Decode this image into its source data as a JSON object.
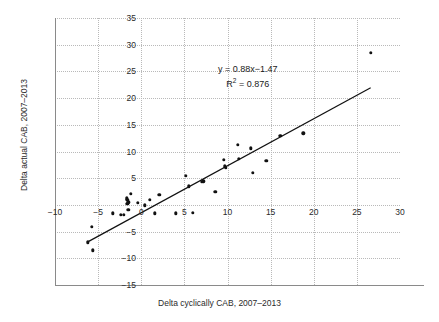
{
  "chart_data": {
    "type": "scatter",
    "title": "",
    "xlabel": "Delta cyclically CAB, 2007–2013",
    "ylabel": "Delta actual CAB, 2007–2013",
    "xlim": [
      -10,
      30
    ],
    "ylim": [
      -15,
      35
    ],
    "xticks": [
      -10,
      -5,
      0,
      5,
      10,
      15,
      20,
      25,
      30
    ],
    "xticklabels": [
      "−10",
      "−5",
      "0",
      "5",
      "10",
      "15",
      "20",
      "25",
      "30"
    ],
    "yticks": [
      -15,
      -10,
      -5,
      0,
      5,
      10,
      15,
      20,
      25,
      30,
      35
    ],
    "yticklabels": [
      "−15",
      "−10",
      "−5",
      "",
      "5",
      "10",
      "15",
      "20",
      "25",
      "30",
      "35"
    ],
    "grid": true,
    "grid_style": "dotted",
    "legend": null,
    "marker_color": "#111111",
    "line_color": "#111111",
    "grid_color": "#b9b9b9",
    "annotations": [
      {
        "text": "y = 0.88x−1.47"
      },
      {
        "text": "R² = 0.876"
      }
    ],
    "fit": {
      "slope": 0.88,
      "intercept": -1.47,
      "r_squared": 0.876,
      "x_start": -6.2,
      "x_end": 26.6
    },
    "points": [
      {
        "x": -6.2,
        "y": -7.0
      },
      {
        "x": -5.7,
        "y": -4.1
      },
      {
        "x": -5.6,
        "y": -8.5
      },
      {
        "x": -3.3,
        "y": -1.6
      },
      {
        "x": -2.4,
        "y": -1.9
      },
      {
        "x": -2.0,
        "y": -1.9
      },
      {
        "x": -1.7,
        "y": 1.2
      },
      {
        "x": -1.6,
        "y": 0.9
      },
      {
        "x": -1.6,
        "y": 0.2
      },
      {
        "x": -1.5,
        "y": 0.5
      },
      {
        "x": -1.5,
        "y": -0.9
      },
      {
        "x": -1.2,
        "y": 2.1
      },
      {
        "x": -0.4,
        "y": 0.4
      },
      {
        "x": 0.4,
        "y": -0.1
      },
      {
        "x": 1.0,
        "y": 1.0
      },
      {
        "x": 1.6,
        "y": -1.6
      },
      {
        "x": 2.1,
        "y": 1.9
      },
      {
        "x": 4.0,
        "y": -1.6
      },
      {
        "x": 5.2,
        "y": 5.4
      },
      {
        "x": 5.5,
        "y": 3.5
      },
      {
        "x": 6.0,
        "y": -1.5
      },
      {
        "x": 7.0,
        "y": 4.3
      },
      {
        "x": 7.2,
        "y": 4.4
      },
      {
        "x": 8.6,
        "y": 2.4
      },
      {
        "x": 9.6,
        "y": 8.4
      },
      {
        "x": 9.7,
        "y": 7.2
      },
      {
        "x": 9.8,
        "y": 7.0
      },
      {
        "x": 11.2,
        "y": 11.2
      },
      {
        "x": 11.3,
        "y": 8.6
      },
      {
        "x": 12.7,
        "y": 10.6
      },
      {
        "x": 12.9,
        "y": 6.0
      },
      {
        "x": 14.5,
        "y": 8.3
      },
      {
        "x": 16.1,
        "y": 12.9
      },
      {
        "x": 18.8,
        "y": 13.4
      },
      {
        "x": 26.6,
        "y": 28.5
      }
    ]
  }
}
